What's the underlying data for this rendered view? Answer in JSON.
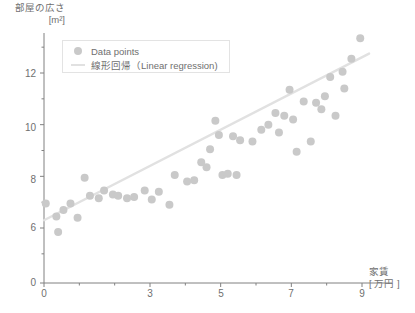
{
  "chart_data": {
    "type": "scatter",
    "title": "",
    "xlabel": "家賃",
    "xlabel_unit": "[ 万円 ]",
    "ylabel": "部屋の広さ",
    "ylabel_unit": "[m²]",
    "xlim": [
      0,
      9.35
    ],
    "ylim_display": [
      0,
      13.6
    ],
    "y_axis_break": true,
    "grid": false,
    "legend_position": "upper-left-inside",
    "xticks": [
      0,
      3,
      5,
      7,
      9
    ],
    "xtick_labels": [
      "0",
      "3",
      "5",
      "7",
      "9"
    ],
    "x_minor_ticks": [
      1,
      2,
      4,
      6,
      8
    ],
    "yticks": [
      0,
      6,
      8,
      10,
      12
    ],
    "ytick_labels": [
      "0",
      "6",
      "8",
      "10",
      "12"
    ],
    "y_minor_ticks": [
      5,
      7,
      9,
      11,
      13
    ],
    "colors": {
      "points": "#c9c9c9",
      "line": "#e1e1e1",
      "axis": "#808080",
      "text": "#6f6f6f",
      "legend_border": "#e3e3e3",
      "background": "#ffffff"
    },
    "series": [
      {
        "name": "Data points",
        "marker": "circle",
        "marker_size": 8,
        "points": [
          [
            0.05,
            6.95
          ],
          [
            0.35,
            6.45
          ],
          [
            0.4,
            5.85
          ],
          [
            0.55,
            6.7
          ],
          [
            0.75,
            6.95
          ],
          [
            0.95,
            6.4
          ],
          [
            1.15,
            7.95
          ],
          [
            1.3,
            7.25
          ],
          [
            1.55,
            7.15
          ],
          [
            1.7,
            7.45
          ],
          [
            1.95,
            7.3
          ],
          [
            2.1,
            7.25
          ],
          [
            2.35,
            7.15
          ],
          [
            2.55,
            7.2
          ],
          [
            2.85,
            7.45
          ],
          [
            3.05,
            7.1
          ],
          [
            3.25,
            7.4
          ],
          [
            3.55,
            6.9
          ],
          [
            3.7,
            8.05
          ],
          [
            4.05,
            7.8
          ],
          [
            4.25,
            7.85
          ],
          [
            4.45,
            8.55
          ],
          [
            4.6,
            8.35
          ],
          [
            4.7,
            9.05
          ],
          [
            4.85,
            10.15
          ],
          [
            4.95,
            9.6
          ],
          [
            5.05,
            8.05
          ],
          [
            5.2,
            8.1
          ],
          [
            5.35,
            9.55
          ],
          [
            5.45,
            8.05
          ],
          [
            5.55,
            9.4
          ],
          [
            5.9,
            9.35
          ],
          [
            6.15,
            9.8
          ],
          [
            6.35,
            10.0
          ],
          [
            6.55,
            10.45
          ],
          [
            6.65,
            9.7
          ],
          [
            6.8,
            10.35
          ],
          [
            6.95,
            11.35
          ],
          [
            7.05,
            10.2
          ],
          [
            7.15,
            8.95
          ],
          [
            7.35,
            10.9
          ],
          [
            7.55,
            9.35
          ],
          [
            7.7,
            10.85
          ],
          [
            7.85,
            10.6
          ],
          [
            7.95,
            11.1
          ],
          [
            8.1,
            11.85
          ],
          [
            8.25,
            10.35
          ],
          [
            8.45,
            12.05
          ],
          [
            8.5,
            11.4
          ],
          [
            8.7,
            12.55
          ],
          [
            8.95,
            13.35
          ]
        ]
      },
      {
        "name": "線形回帰（Linear regression）",
        "type": "line",
        "endpoints": [
          [
            0.0,
            6.3
          ],
          [
            9.2,
            12.75
          ]
        ],
        "slope": 0.7,
        "intercept": 6.3
      }
    ]
  },
  "legend": {
    "items": [
      {
        "label": "Data points",
        "marker": "dot"
      },
      {
        "label": "線形回帰（Linear regression)",
        "marker": "line"
      }
    ]
  },
  "axes": {
    "y_title_line1": "部屋の広さ",
    "y_title_line2": "[m²]",
    "x_title_line1": "家賃",
    "x_title_line2": "[ 万円 ]",
    "ytick_0": "0",
    "ytick_6": "6",
    "ytick_8": "8",
    "ytick_10": "10",
    "ytick_12": "12",
    "xtick_0": "0",
    "xtick_3": "3",
    "xtick_5": "5",
    "xtick_7": "7",
    "xtick_9": "9"
  }
}
